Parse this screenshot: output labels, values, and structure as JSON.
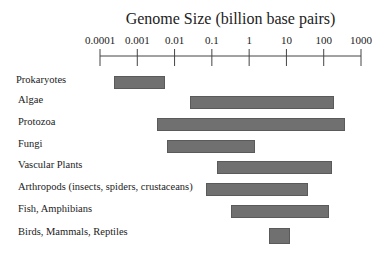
{
  "chart_data": {
    "type": "bar",
    "orientation": "horizontal-range",
    "title": "Genome Size (billion base pairs)",
    "xlabel": "Genome Size (billion base pairs)",
    "ylabel": "",
    "xscale": "log",
    "xlim": [
      0.0001,
      1000
    ],
    "x_ticks": [
      "0.0001",
      "0.001",
      "0.01",
      "0.1",
      "1",
      "10",
      "100",
      "1000"
    ],
    "grid": false,
    "legend": null,
    "categories": [
      "Prokaryotes",
      "Algae",
      "Protozoa",
      "Fungi",
      "Vascular Plants",
      "Arthropods (insects, spiders, crustaceans)",
      "Fish, Amphibians",
      "Birds, Mammals, Reptiles"
    ],
    "ranges": [
      {
        "label": "Prokaryotes",
        "min": 0.00024,
        "max": 0.0056
      },
      {
        "label": "Algae",
        "min": 0.026,
        "max": 190
      },
      {
        "label": "Protozoa",
        "min": 0.0034,
        "max": 375
      },
      {
        "label": "Fungi",
        "min": 0.0063,
        "max": 1.4
      },
      {
        "label": "Vascular Plants",
        "min": 0.14,
        "max": 170
      },
      {
        "label": "Arthropods (insects, spiders, crustaceans)",
        "min": 0.07,
        "max": 38
      },
      {
        "label": "Fish, Amphibians",
        "min": 0.33,
        "max": 140
      },
      {
        "label": "Birds, Mammals, Reptiles",
        "min": 3.4,
        "max": 12.6
      }
    ],
    "bar_color": "#707070"
  }
}
